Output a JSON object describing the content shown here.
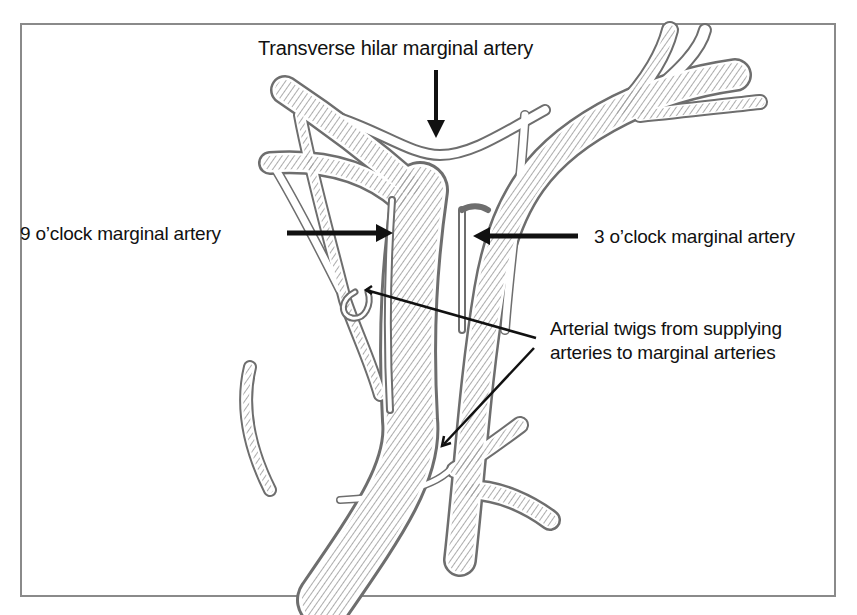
{
  "figure": {
    "frame_color": "#8a8a8a",
    "vessel_outline_color": "#6e6e6e",
    "vessel_hatch_color": "#8c8c8c",
    "arrow_color": "#111111",
    "labels": {
      "transverse": "Transverse hilar marginal artery",
      "nine_oclock": "9 o’clock marginal artery",
      "three_oclock": "3 o’clock marginal artery",
      "twigs_line1": "Arterial twigs from supplying",
      "twigs_line2": "arteries to marginal arteries"
    },
    "annotations": [
      {
        "id": "transverse",
        "text": "Transverse hilar marginal artery",
        "arrow": "down",
        "target": "hilar arch"
      },
      {
        "id": "nine_oclock",
        "text": "9 o’clock marginal artery",
        "arrow": "right",
        "target": "left marginal artery"
      },
      {
        "id": "three_oclock",
        "text": "3 o’clock marginal artery",
        "arrow": "left",
        "target": "right marginal artery"
      },
      {
        "id": "twigs",
        "text": "Arterial twigs from supplying arteries to marginal arteries",
        "arrow": "two leader lines",
        "target": "communicating twigs"
      }
    ]
  }
}
